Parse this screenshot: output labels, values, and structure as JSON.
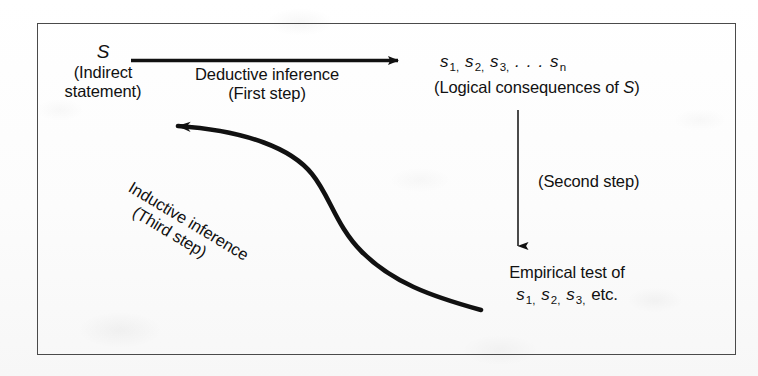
{
  "figure": {
    "kind": "flow-diagram",
    "border_color": "#4a4a4a",
    "ink_color": "#111111",
    "background_color": "#fdfdfd"
  },
  "nodes": {
    "statement": {
      "symbol": "S",
      "line1": "(Indirect",
      "line2": "statement)"
    },
    "consequences": {
      "sequence_prefix": "s",
      "sub1": "1,",
      "sub2": "2,",
      "sub3": "3,",
      "ellipsis": ". . .",
      "subn": "n",
      "caption_open": "(Logical consequences of ",
      "caption_symbol": "S",
      "caption_close": ")"
    },
    "empirical_test": {
      "line1": "Empirical test of",
      "sequence_prefix": "s",
      "sub1": "1,",
      "sub2": "2,",
      "sub3": "3,",
      "trailing": "etc."
    }
  },
  "edges": {
    "deductive": {
      "label_line1": "Deductive inference",
      "label_line2": "(First step)",
      "arrow": "arrow-right"
    },
    "second": {
      "label": "(Second step)",
      "arrow": "arrow-down"
    },
    "inductive": {
      "label_line1": "Inductive inference",
      "label_line2": "(Third step)",
      "arrow": "arrow-curve-up-left"
    }
  }
}
